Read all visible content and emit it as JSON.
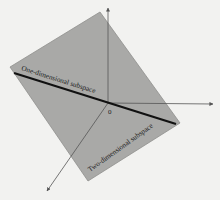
{
  "diagram": {
    "type": "subspaces-in-R3",
    "colors": {
      "background": "#f2f2f0",
      "plane_fill": "#a9a9a7",
      "plane_edge": "#8f8f8d",
      "axis": "#555555",
      "line": "#111111",
      "text": "#1a1a1a"
    },
    "plane": {
      "label": "Two-dimensional subspace",
      "corners": [
        [
          100,
          12
        ],
        [
          180,
          123
        ],
        [
          88,
          181
        ],
        [
          10,
          67
        ]
      ]
    },
    "line": {
      "label": "One-dimensional subspace",
      "from": [
        14,
        73
      ],
      "to": [
        176,
        124
      ]
    },
    "origin": {
      "label": "0",
      "point": [
        108,
        103
      ]
    },
    "axes": [
      {
        "name": "z-axis",
        "from": [
          108,
          103
        ],
        "to": [
          108,
          8
        ]
      },
      {
        "name": "x-axis",
        "from": [
          108,
          103
        ],
        "to": [
          213,
          104
        ]
      },
      {
        "name": "y-axis",
        "from": [
          108,
          103
        ],
        "to": [
          47,
          191
        ]
      }
    ]
  }
}
